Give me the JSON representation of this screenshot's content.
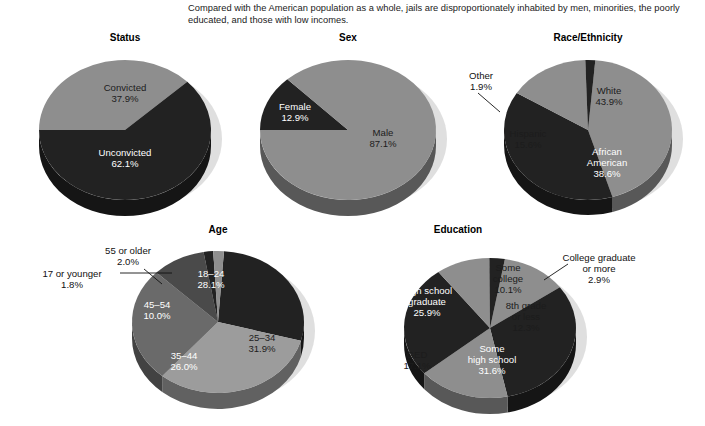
{
  "caption": "Compared with the American population as a whole, jails are disproportionately inhabited by men, minorities, the poorly educated, and those with low incomes.",
  "palette": {
    "dark": "#222222",
    "dark_side": "#121212",
    "mid_dark": "#4a4a4a",
    "mid": "#6a6a6a",
    "mid_side": "#4e4e4e",
    "light": "#8e8e8e",
    "light2": "#9c9c9c",
    "light_side": "#6e6e6e",
    "shadow": "#d9d9d9",
    "background": "#ffffff",
    "label_on_dark": "#ffffff",
    "label_on_light": "#1c1c1c"
  },
  "chart_data": [
    {
      "type": "pie",
      "title": "Status",
      "categories": [
        "Convicted",
        "Unconvicted"
      ],
      "values": [
        37.9,
        62.1
      ],
      "labels": [
        "Convicted\n37.9%",
        "Unconvicted\n62.1%"
      ],
      "slices": [
        {
          "name": "Convicted",
          "value": 37.9,
          "value_label": "37.9%",
          "color": "light"
        },
        {
          "name": "Unconvicted",
          "value": 62.1,
          "value_label": "62.1%",
          "color": "dark"
        }
      ]
    },
    {
      "type": "pie",
      "title": "Sex",
      "categories": [
        "Female",
        "Male"
      ],
      "values": [
        12.9,
        87.1
      ],
      "labels": [
        "Female\n12.9%",
        "Male\n87.1%"
      ],
      "slices": [
        {
          "name": "Female",
          "value": 12.9,
          "value_label": "12.9%",
          "color": "dark"
        },
        {
          "name": "Male",
          "value": 87.1,
          "value_label": "87.1%",
          "color": "light"
        }
      ]
    },
    {
      "type": "pie",
      "title": "Race/Ethnicity",
      "categories": [
        "White",
        "African American",
        "Hispanic",
        "Other"
      ],
      "values": [
        43.9,
        38.6,
        15.6,
        1.9
      ],
      "labels": [
        "White\n43.9%",
        "African\nAmerican\n38.6%",
        "Hispanic\n15.6%",
        "Other\n1.9%"
      ],
      "slices": [
        {
          "name": "White",
          "value": 43.9,
          "value_label": "43.9%",
          "color": "light"
        },
        {
          "name": "African American",
          "value": 38.6,
          "value_label": "38.6%",
          "color": "dark"
        },
        {
          "name": "Hispanic",
          "value": 15.6,
          "value_label": "15.6%",
          "color": "light"
        },
        {
          "name": "Other",
          "value": 1.9,
          "value_label": "1.9%",
          "color": "dark"
        }
      ]
    },
    {
      "type": "pie",
      "title": "Age",
      "categories": [
        "18-24",
        "25-34",
        "35-44",
        "45-54",
        "55 or older",
        "17 or younger"
      ],
      "values": [
        28.1,
        31.9,
        26.0,
        10.0,
        2.0,
        1.8
      ],
      "labels": [
        "18–24\n28.1%",
        "25–34\n31.9%",
        "35–44\n26.0%",
        "45–54\n10.0%",
        "55 or older\n2.0%",
        "17 or younger\n1.8%"
      ],
      "slices": [
        {
          "name": "18–24",
          "value": 28.1,
          "value_label": "28.1%",
          "color": "dark"
        },
        {
          "name": "25–34",
          "value": 31.9,
          "value_label": "31.9%",
          "color": "light2"
        },
        {
          "name": "35–44",
          "value": 26.0,
          "value_label": "26.0%",
          "color": "mid"
        },
        {
          "name": "45–54",
          "value": 10.0,
          "value_label": "10.0%",
          "color": "mid_dark"
        },
        {
          "name": "17 or younger",
          "value": 1.8,
          "value_label": "1.8%",
          "color": "dark"
        },
        {
          "name": "55 or older",
          "value": 2.0,
          "value_label": "2.0%",
          "color": "light"
        }
      ]
    },
    {
      "type": "pie",
      "title": "Education",
      "categories": [
        "8th grade or less",
        "Some high school",
        "GED",
        "High school graduate",
        "Some college",
        "College graduate or more"
      ],
      "values": [
        12.3,
        31.6,
        17.1,
        25.9,
        10.1,
        2.9
      ],
      "labels": [
        "8th grade\nor less\n12.3%",
        "Some\nhigh school\n31.6%",
        "GED\n17.1%",
        "High school\ngraduate\n25.9%",
        "Some\ncollege\n10.1%",
        "College graduate\nor more\n2.9%"
      ],
      "slices": [
        {
          "name": "8th grade or less",
          "value": 12.3,
          "value_label": "12.3%",
          "color": "light"
        },
        {
          "name": "Some high school",
          "value": 31.6,
          "value_label": "31.6%",
          "color": "dark"
        },
        {
          "name": "GED",
          "value": 17.1,
          "value_label": "17.1%",
          "color": "light"
        },
        {
          "name": "High school graduate",
          "value": 25.9,
          "value_label": "25.9%",
          "color": "dark"
        },
        {
          "name": "Some college",
          "value": 10.1,
          "value_label": "10.1%",
          "color": "light"
        },
        {
          "name": "College graduate or more",
          "value": 2.9,
          "value_label": "2.9%",
          "color": "dark"
        }
      ]
    }
  ],
  "charts": {
    "status": {
      "title": "Status",
      "label_convicted_name": "Convicted",
      "label_convicted_pct": "37.9%",
      "label_unconvicted_name": "Unconvicted",
      "label_unconvicted_pct": "62.1%"
    },
    "sex": {
      "title": "Sex",
      "label_female_name": "Female",
      "label_female_pct": "12.9%",
      "label_male_name": "Male",
      "label_male_pct": "87.1%"
    },
    "race": {
      "title": "Race/Ethnicity",
      "label_white_name": "White",
      "label_white_pct": "43.9%",
      "label_african_l1": "African",
      "label_african_l2": "American",
      "label_african_pct": "38.6%",
      "label_hispanic_name": "Hispanic",
      "label_hispanic_pct": "15.6%",
      "label_other_name": "Other",
      "label_other_pct": "1.9%"
    },
    "age": {
      "title": "Age",
      "label_1824_name": "18–24",
      "label_1824_pct": "28.1%",
      "label_2534_name": "25–34",
      "label_2534_pct": "31.9%",
      "label_3544_name": "35–44",
      "label_3544_pct": "26.0%",
      "label_4554_name": "45–54",
      "label_4554_pct": "10.0%",
      "label_55plus_name": "55 or older",
      "label_55plus_pct": "2.0%",
      "label_17under_name": "17 or younger",
      "label_17under_pct": "1.8%"
    },
    "education": {
      "title": "Education",
      "label_8th_l1": "8th grade",
      "label_8th_l2": "or less",
      "label_8th_pct": "12.3%",
      "label_somehs_l1": "Some",
      "label_somehs_l2": "high school",
      "label_somehs_pct": "31.6%",
      "label_ged_name": "GED",
      "label_ged_pct": "17.1%",
      "label_hsgrad_l1": "High school",
      "label_hsgrad_l2": "graduate",
      "label_hsgrad_pct": "25.9%",
      "label_somecoll_l1": "Some",
      "label_somecoll_l2": "college",
      "label_somecoll_pct": "10.1%",
      "label_collgrad_l1": "College graduate",
      "label_collgrad_l2": "or more",
      "label_collgrad_pct": "2.9%"
    }
  }
}
